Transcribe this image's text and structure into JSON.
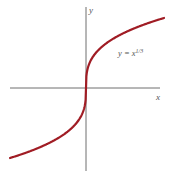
{
  "chart_data": {
    "type": "line",
    "title": "",
    "function": "y = x^(1/3)",
    "annotation": {
      "base": "y = x",
      "exponent": "1/3"
    },
    "xlabel": "x",
    "ylabel": "y",
    "xlim": [
      -1,
      1
    ],
    "ylim": [
      -1,
      1
    ],
    "grid": false,
    "legend": null,
    "ticks": false,
    "series": [
      {
        "name": "y = x^(1/3)",
        "color": "#a01c24",
        "x": [
          -1,
          -0.75,
          -0.5,
          -0.25,
          -0.1,
          -0.01,
          0,
          0.01,
          0.1,
          0.25,
          0.5,
          0.75,
          1
        ],
        "y": [
          -1,
          -0.909,
          -0.794,
          -0.63,
          -0.464,
          -0.215,
          0,
          0.215,
          0.464,
          0.63,
          0.794,
          0.909,
          1
        ]
      }
    ]
  },
  "colors": {
    "curve": "#a01c24",
    "axes": "#6e6e6e",
    "labels": "#555555"
  },
  "labels": {
    "x_axis": "x",
    "y_axis": "y",
    "curve_base": "y = x",
    "curve_exp": "1/3"
  }
}
